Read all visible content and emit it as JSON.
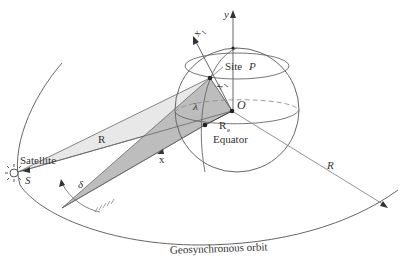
{
  "figure": {
    "colors": {
      "line": "#555555",
      "shade_light": "#e6e6e6",
      "shade_dark": "#bdbdbd",
      "text": "#333333",
      "background": "#ffffff"
    }
  },
  "labels": {
    "satellite": "Satellite",
    "satellite_point": "S",
    "range": "R",
    "angle_delta": "δ",
    "x_axis": "x",
    "y_axis": "y",
    "x1_axis": "x",
    "x1_sub": "1",
    "x2_axis": "x",
    "x2_sub": "1",
    "site": "Site",
    "site_point": "P",
    "latitude": "λ",
    "origin": "O",
    "earth_radius": "R",
    "earth_radius_sub": "e",
    "equator": "Equator",
    "orbit_radius": "R",
    "orbit": "Geosynchronous orbit"
  },
  "icons": {
    "satellite": "sun-like-circle-with-rays"
  }
}
